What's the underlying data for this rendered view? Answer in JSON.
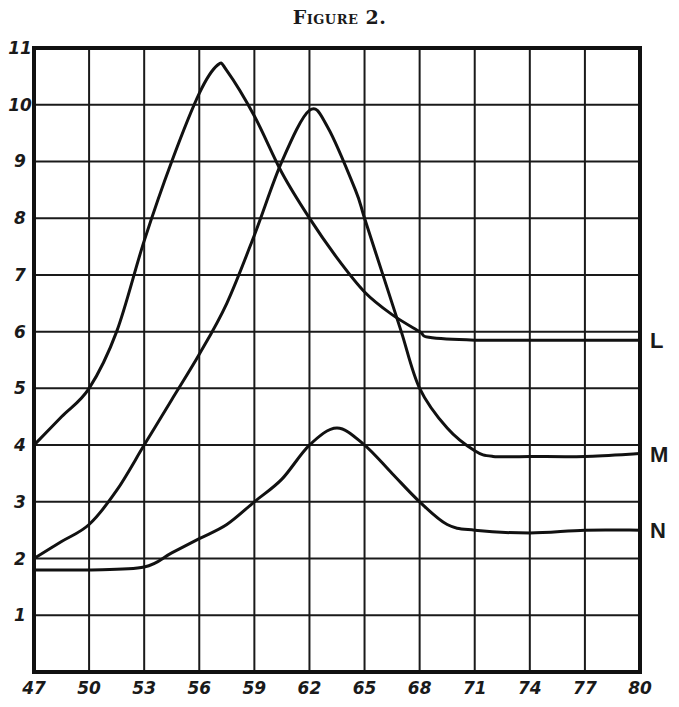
{
  "figure": {
    "title": "Figure 2."
  },
  "chart_data": {
    "type": "line",
    "title": "Figure 2.",
    "xlabel": "",
    "ylabel": "",
    "xlim": [
      47,
      80
    ],
    "ylim": [
      0,
      11
    ],
    "grid": true,
    "x_ticks": [
      47,
      50,
      53,
      56,
      59,
      62,
      65,
      68,
      71,
      74,
      77,
      80
    ],
    "y_ticks": [
      1,
      2,
      3,
      4,
      5,
      6,
      7,
      8,
      9,
      10,
      11
    ],
    "legend": "labels at right end of each curve",
    "series": [
      {
        "name": "L",
        "points": [
          [
            47,
            4.0
          ],
          [
            48.5,
            4.5
          ],
          [
            50,
            5.0
          ],
          [
            51.5,
            6.0
          ],
          [
            53,
            7.6
          ],
          [
            54.5,
            9.0
          ],
          [
            56,
            10.2
          ],
          [
            57,
            10.7
          ],
          [
            57.5,
            10.6
          ],
          [
            59,
            9.8
          ],
          [
            60.5,
            8.8
          ],
          [
            62,
            8.0
          ],
          [
            63.5,
            7.3
          ],
          [
            65,
            6.7
          ],
          [
            66.5,
            6.3
          ],
          [
            68,
            6.0
          ],
          [
            68.5,
            5.9
          ],
          [
            71,
            5.85
          ],
          [
            74,
            5.85
          ],
          [
            77,
            5.85
          ],
          [
            80,
            5.85
          ]
        ]
      },
      {
        "name": "M",
        "points": [
          [
            47,
            2.0
          ],
          [
            48.5,
            2.3
          ],
          [
            50,
            2.6
          ],
          [
            51.5,
            3.2
          ],
          [
            53,
            4.0
          ],
          [
            54.5,
            4.8
          ],
          [
            56,
            5.6
          ],
          [
            57.5,
            6.5
          ],
          [
            59,
            7.7
          ],
          [
            60.5,
            9.0
          ],
          [
            62,
            9.9
          ],
          [
            63,
            9.6
          ],
          [
            64.5,
            8.5
          ],
          [
            65,
            8.0
          ],
          [
            66,
            7.0
          ],
          [
            67,
            6.0
          ],
          [
            68,
            5.0
          ],
          [
            69.5,
            4.3
          ],
          [
            71,
            3.9
          ],
          [
            72,
            3.8
          ],
          [
            74,
            3.8
          ],
          [
            77,
            3.8
          ],
          [
            80,
            3.85
          ]
        ]
      },
      {
        "name": "N",
        "points": [
          [
            47,
            1.8
          ],
          [
            50,
            1.8
          ],
          [
            53,
            1.85
          ],
          [
            54.5,
            2.1
          ],
          [
            56,
            2.35
          ],
          [
            57.5,
            2.6
          ],
          [
            59,
            3.0
          ],
          [
            60.5,
            3.4
          ],
          [
            62,
            4.0
          ],
          [
            63.5,
            4.3
          ],
          [
            65,
            4.0
          ],
          [
            66.5,
            3.5
          ],
          [
            68,
            3.0
          ],
          [
            69.5,
            2.6
          ],
          [
            71,
            2.5
          ],
          [
            74,
            2.45
          ],
          [
            77,
            2.5
          ],
          [
            80,
            2.5
          ]
        ]
      }
    ]
  }
}
